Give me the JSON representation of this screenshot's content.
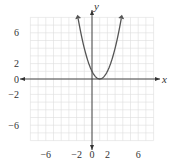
{
  "chart_data": {
    "type": "line",
    "title": "",
    "function": "y = (x - 1)^2",
    "xlabel": "x",
    "ylabel": "y",
    "xlim": [
      -8,
      8
    ],
    "ylim": [
      -8,
      8
    ],
    "grid": true,
    "grid_step": 1,
    "x_ticks": [
      {
        "value": -6,
        "label": "−6"
      },
      {
        "value": -2,
        "label": "−2"
      },
      {
        "value": 0,
        "label": "0"
      },
      {
        "value": 2,
        "label": "2"
      },
      {
        "value": 6,
        "label": "6"
      }
    ],
    "y_ticks": [
      {
        "value": 6,
        "label": "6"
      },
      {
        "value": 2,
        "label": "2"
      },
      {
        "value": 0,
        "label": "0"
      },
      {
        "value": -2,
        "label": "−2"
      },
      {
        "value": -6,
        "label": "−6"
      }
    ],
    "series": [
      {
        "name": "parabola",
        "x_range": [
          -1.8,
          3.8
        ],
        "vertex": [
          1,
          0
        ],
        "end_arrows": true
      }
    ],
    "colors": {
      "grid": "#dddddd",
      "axis": "#333333",
      "curve": "#555555"
    }
  }
}
